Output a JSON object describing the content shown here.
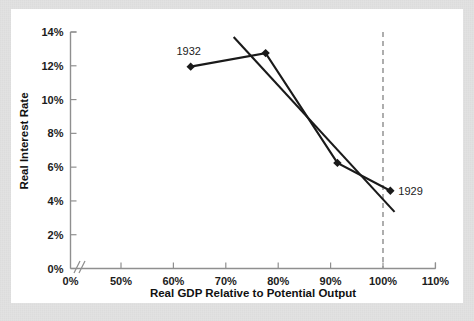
{
  "chart_data": {
    "type": "line",
    "title": "",
    "xlabel": "Real GDP Relative to Potential Output",
    "ylabel": "Real Interest Rate",
    "xlim": [
      45,
      112
    ],
    "ylim": [
      0,
      14
    ],
    "grid": false,
    "legend": "none",
    "x_ticks": [
      {
        "value": 0,
        "label": "0%"
      },
      {
        "value": 50,
        "label": "50%"
      },
      {
        "value": 60,
        "label": "60%"
      },
      {
        "value": 70,
        "label": "70%"
      },
      {
        "value": 80,
        "label": "80%"
      },
      {
        "value": 90,
        "label": "90%"
      },
      {
        "value": 100,
        "label": "100%"
      },
      {
        "value": 110,
        "label": "110%"
      }
    ],
    "y_ticks": [
      {
        "value": 0,
        "label": "0%"
      },
      {
        "value": 2,
        "label": "2%"
      },
      {
        "value": 4,
        "label": "4%"
      },
      {
        "value": 6,
        "label": "6%"
      },
      {
        "value": 8,
        "label": "8%"
      },
      {
        "value": 10,
        "label": "10%"
      },
      {
        "value": 12,
        "label": "12%"
      },
      {
        "value": 14,
        "label": "14%"
      }
    ],
    "axis_break": true,
    "axis_break_label": "//",
    "series": [
      {
        "name": "observed-path",
        "style": "line-with-markers",
        "points": [
          {
            "x": 63.3,
            "y": 11.95,
            "label": "1932"
          },
          {
            "x": 77.6,
            "y": 12.75,
            "label": ""
          },
          {
            "x": 91.3,
            "y": 6.25,
            "label": ""
          },
          {
            "x": 101.4,
            "y": 4.6,
            "label": "1929"
          }
        ]
      },
      {
        "name": "fitted-trend",
        "style": "line",
        "points": [
          {
            "x": 71.5,
            "y": 13.7
          },
          {
            "x": 102.2,
            "y": 3.35
          }
        ]
      }
    ],
    "annotations": [
      {
        "text": "1932",
        "x": 63.3,
        "y": 11.95,
        "position": "above-left"
      },
      {
        "text": "1929",
        "x": 101.4,
        "y": 4.6,
        "position": "right"
      }
    ],
    "reference_lines": [
      {
        "name": "potential-output",
        "orientation": "vertical",
        "value": 100,
        "style": "dashed",
        "color": "#9a9a9a"
      }
    ],
    "colors": {
      "series": "#1a1a1a",
      "axis": "#8f8f8f",
      "reference": "#9a9a9a",
      "panel_background": "#ffffff",
      "figure_background": "#e2e2e2"
    }
  }
}
